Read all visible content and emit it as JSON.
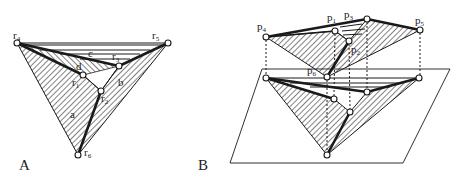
{
  "panels": [
    {
      "id": "A",
      "label": "A",
      "vertices": [
        {
          "name": "r4",
          "base": "r",
          "sub": "4"
        },
        {
          "name": "r5",
          "base": "r",
          "sub": "5"
        },
        {
          "name": "r3",
          "base": "r",
          "sub": "3"
        },
        {
          "name": "r1",
          "base": "r",
          "sub": "1"
        },
        {
          "name": "r2",
          "base": "r",
          "sub": "2"
        },
        {
          "name": "r6",
          "base": "r",
          "sub": "6"
        }
      ],
      "face_labels": [
        "a",
        "b",
        "c",
        "d"
      ]
    },
    {
      "id": "B",
      "label": "B",
      "vertices": [
        {
          "name": "p4",
          "base": "p",
          "sub": "4"
        },
        {
          "name": "p1",
          "base": "p",
          "sub": "1"
        },
        {
          "name": "p3",
          "base": "p",
          "sub": "3"
        },
        {
          "name": "p5",
          "base": "p",
          "sub": "5"
        },
        {
          "name": "p2",
          "base": "p",
          "sub": "2"
        },
        {
          "name": "p6",
          "base": "p",
          "sub": "6"
        }
      ]
    }
  ],
  "colors": {
    "ink": "#1a1a1a",
    "background": "#ffffff"
  }
}
